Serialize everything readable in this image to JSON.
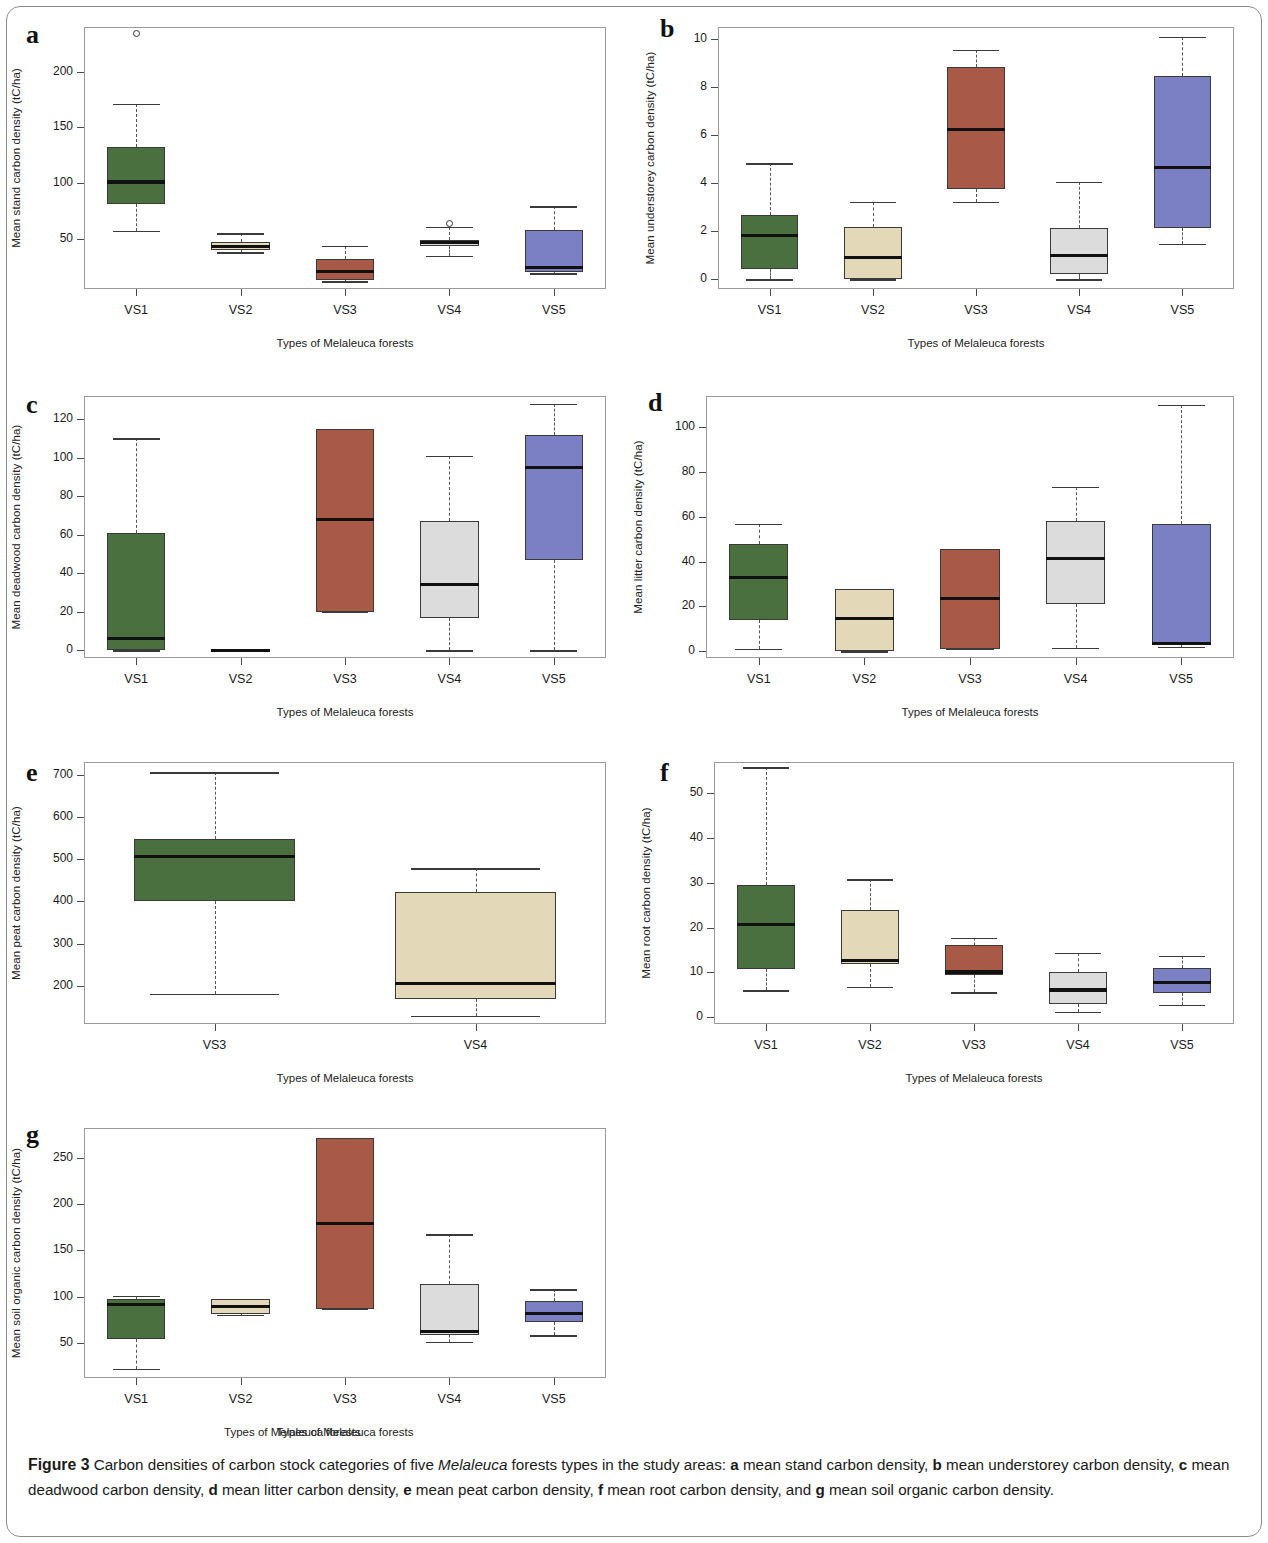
{
  "figure": {
    "number_label": "Figure 3",
    "caption_parts": [
      {
        "t": "  Carbon densities of carbon stock categories of five ",
        "s": "plain"
      },
      {
        "t": "Melaleuca",
        "s": "italic"
      },
      {
        "t": " forests types in the study areas: ",
        "s": "plain"
      },
      {
        "t": "a",
        "s": "bold"
      },
      {
        "t": " mean stand carbon density, ",
        "s": "plain"
      },
      {
        "t": "b",
        "s": "bold"
      },
      {
        "t": " mean understorey carbon density, ",
        "s": "plain"
      },
      {
        "t": "c",
        "s": "bold"
      },
      {
        "t": " mean deadwood carbon density, ",
        "s": "plain"
      },
      {
        "t": "d",
        "s": "bold"
      },
      {
        "t": " mean litter carbon density, ",
        "s": "plain"
      },
      {
        "t": "e",
        "s": "bold"
      },
      {
        "t": " mean peat carbon density, ",
        "s": "plain"
      },
      {
        "t": "f",
        "s": "bold"
      },
      {
        "t": " mean root carbon density, and ",
        "s": "plain"
      },
      {
        "t": "g",
        "s": "bold"
      },
      {
        "t": " mean soil organic carbon density.",
        "s": "plain"
      }
    ],
    "stray_axis_label": "Types of Melaleuca forests"
  },
  "palette": {
    "VS1": "#4a7040",
    "VS2": "#e3d9b8",
    "VS3": "#a85a47",
    "VS4": "#dcdcdc",
    "VS5": "#7b7fc4",
    "box_stroke": "#3a3a3a",
    "median": "#111111",
    "axis": "#9a9a9a"
  },
  "chart_data": [
    {
      "id": "a",
      "type": "box",
      "panel_letter": "a",
      "title": "",
      "xlabel": "Types of Melaleuca forests",
      "ylabel": "Mean stand carbon density (tC/ha)",
      "categories": [
        "VS1",
        "VS2",
        "VS3",
        "VS4",
        "VS5"
      ],
      "ylim": [
        5,
        240
      ],
      "yticks": [
        50,
        100,
        150,
        200
      ],
      "boxes": [
        {
          "cat": "VS1",
          "color": "VS1",
          "whisker_low": 57,
          "q1": 81,
          "median": 101,
          "q3": 132,
          "whisker_high": 171,
          "outliers": [
            234
          ]
        },
        {
          "cat": "VS2",
          "color": "VS2",
          "whisker_low": 38,
          "q1": 40,
          "median": 43,
          "q3": 47,
          "whisker_high": 55,
          "outliers": []
        },
        {
          "cat": "VS3",
          "color": "VS3",
          "whisker_low": 12,
          "q1": 13,
          "median": 21,
          "q3": 32,
          "whisker_high": 44,
          "outliers": []
        },
        {
          "cat": "VS4",
          "color": "VS4",
          "whisker_low": 35,
          "q1": 44,
          "median": 47,
          "q3": 49,
          "whisker_high": 61,
          "outliers": [
            64
          ]
        },
        {
          "cat": "VS5",
          "color": "VS5",
          "whisker_low": 19,
          "q1": 20,
          "median": 24,
          "q3": 58,
          "whisker_high": 79,
          "outliers": []
        }
      ]
    },
    {
      "id": "b",
      "type": "box",
      "panel_letter": "b",
      "title": "",
      "xlabel": "Types of Melaleuca forests",
      "ylabel": "Mean understorey carbon density (tC/ha)",
      "categories": [
        "VS1",
        "VS2",
        "VS3",
        "VS4",
        "VS5"
      ],
      "ylim": [
        -0.4,
        10.5
      ],
      "yticks": [
        0,
        2,
        4,
        6,
        8,
        10
      ],
      "boxes": [
        {
          "cat": "VS1",
          "color": "VS1",
          "whisker_low": 0.0,
          "q1": 0.45,
          "median": 1.83,
          "q3": 2.68,
          "whisker_high": 4.83,
          "outliers": []
        },
        {
          "cat": "VS2",
          "color": "VS2",
          "whisker_low": 0.0,
          "q1": 0.0,
          "median": 0.9,
          "q3": 2.2,
          "whisker_high": 3.22,
          "outliers": []
        },
        {
          "cat": "VS3",
          "color": "VS3",
          "whisker_low": 3.22,
          "q1": 3.75,
          "median": 6.22,
          "q3": 8.85,
          "whisker_high": 9.55,
          "outliers": []
        },
        {
          "cat": "VS4",
          "color": "VS4",
          "whisker_low": 0.0,
          "q1": 0.24,
          "median": 0.98,
          "q3": 2.12,
          "whisker_high": 4.05,
          "outliers": []
        },
        {
          "cat": "VS5",
          "color": "VS5",
          "whisker_low": 1.48,
          "q1": 2.12,
          "median": 4.67,
          "q3": 8.48,
          "whisker_high": 10.08,
          "outliers": []
        }
      ]
    },
    {
      "id": "c",
      "type": "box",
      "panel_letter": "c",
      "title": "",
      "xlabel": "Types of Melaleuca forests",
      "ylabel": "Mean deadwood carbon density (tC/ha)",
      "categories": [
        "VS1",
        "VS2",
        "VS3",
        "VS4",
        "VS5"
      ],
      "ylim": [
        -4,
        132
      ],
      "yticks": [
        0,
        20,
        40,
        60,
        80,
        100,
        120
      ],
      "boxes": [
        {
          "cat": "VS1",
          "color": "VS1",
          "whisker_low": 0,
          "q1": 0,
          "median": 6,
          "q3": 61,
          "whisker_high": 110,
          "outliers": []
        },
        {
          "cat": "VS2",
          "color": "VS2",
          "whisker_low": 0,
          "q1": 0,
          "median": 0,
          "q3": 0,
          "whisker_high": 0,
          "flat": true,
          "outliers": []
        },
        {
          "cat": "VS3",
          "color": "VS3",
          "whisker_low": 20,
          "q1": 20,
          "median": 68,
          "q3": 115,
          "whisker_high": 115,
          "outliers": []
        },
        {
          "cat": "VS4",
          "color": "VS4",
          "whisker_low": 0,
          "q1": 17,
          "median": 34,
          "q3": 67,
          "whisker_high": 101,
          "outliers": []
        },
        {
          "cat": "VS5",
          "color": "VS5",
          "whisker_low": 0,
          "q1": 47,
          "median": 95,
          "q3": 112,
          "whisker_high": 128,
          "outliers": []
        }
      ]
    },
    {
      "id": "d",
      "type": "box",
      "panel_letter": "d",
      "title": "",
      "xlabel": "Types of Melaleuca forests",
      "ylabel": "Mean litter carbon density (tC/ha)",
      "categories": [
        "VS1",
        "VS2",
        "VS3",
        "VS4",
        "VS5"
      ],
      "ylim": [
        -3,
        114
      ],
      "yticks": [
        0,
        20,
        40,
        60,
        80,
        100
      ],
      "boxes": [
        {
          "cat": "VS1",
          "color": "VS1",
          "whisker_low": 1,
          "q1": 14,
          "median": 33,
          "q3": 48,
          "whisker_high": 57,
          "outliers": []
        },
        {
          "cat": "VS2",
          "color": "VS2",
          "whisker_low": 0,
          "q1": 0,
          "median": 14.5,
          "q3": 28,
          "whisker_high": 28,
          "outliers": []
        },
        {
          "cat": "VS3",
          "color": "VS3",
          "whisker_low": 1,
          "q1": 1,
          "median": 23.5,
          "q3": 45.5,
          "whisker_high": 45.5,
          "outliers": []
        },
        {
          "cat": "VS4",
          "color": "VS4",
          "whisker_low": 1.5,
          "q1": 21,
          "median": 41.5,
          "q3": 58,
          "whisker_high": 73.5,
          "outliers": []
        },
        {
          "cat": "VS5",
          "color": "VS5",
          "whisker_low": 2,
          "q1": 3,
          "median": 3.5,
          "q3": 57,
          "whisker_high": 110,
          "outliers": []
        }
      ]
    },
    {
      "id": "e",
      "type": "box",
      "panel_letter": "e",
      "title": "",
      "xlabel": "Types of Melaleuca forests",
      "ylabel": "Mean peat carbon density (tC/ha)",
      "categories": [
        "VS3",
        "VS4"
      ],
      "ylim": [
        110,
        730
      ],
      "yticks": [
        200,
        300,
        400,
        500,
        600,
        700
      ],
      "boxes": [
        {
          "cat": "VS3",
          "color": "VS1",
          "whisker_low": 182,
          "q1": 402,
          "median": 507,
          "q3": 548,
          "whisker_high": 706,
          "outliers": []
        },
        {
          "cat": "VS4",
          "color": "VS2",
          "whisker_low": 130,
          "q1": 170,
          "median": 206,
          "q3": 422,
          "whisker_high": 478,
          "outliers": []
        }
      ]
    },
    {
      "id": "f",
      "type": "box",
      "panel_letter": "f",
      "title": "",
      "xlabel": "Types of Melaleuca forests",
      "ylabel": "Mean root carbon density (tC/ha)",
      "categories": [
        "VS1",
        "VS2",
        "VS3",
        "VS4",
        "VS5"
      ],
      "ylim": [
        -1.5,
        57
      ],
      "yticks": [
        0,
        10,
        20,
        30,
        40,
        50
      ],
      "boxes": [
        {
          "cat": "VS1",
          "color": "VS1",
          "whisker_low": 6.0,
          "q1": 10.8,
          "median": 20.8,
          "q3": 29.5,
          "whisker_high": 55.8,
          "outliers": []
        },
        {
          "cat": "VS2",
          "color": "VS2",
          "whisker_low": 6.8,
          "q1": 11.9,
          "median": 12.7,
          "q3": 24.0,
          "whisker_high": 30.8,
          "outliers": []
        },
        {
          "cat": "VS3",
          "color": "VS3",
          "whisker_low": 5.6,
          "q1": 9.5,
          "median": 10.1,
          "q3": 16.2,
          "whisker_high": 17.7,
          "outliers": []
        },
        {
          "cat": "VS4",
          "color": "VS4",
          "whisker_low": 1.2,
          "q1": 3.0,
          "median": 6.1,
          "q3": 10.0,
          "whisker_high": 14.4,
          "outliers": []
        },
        {
          "cat": "VS5",
          "color": "VS5",
          "whisker_low": 2.8,
          "q1": 5.4,
          "median": 7.7,
          "q3": 11.1,
          "whisker_high": 13.7,
          "outliers": []
        }
      ]
    },
    {
      "id": "g",
      "type": "box",
      "panel_letter": "g",
      "title": "",
      "xlabel": "Types of Melaleuca forests",
      "ylabel": "Mean soil organic carbon density (tC/ha)",
      "categories": [
        "VS1",
        "VS2",
        "VS3",
        "VS4",
        "VS5"
      ],
      "ylim": [
        12,
        282
      ],
      "yticks": [
        50,
        100,
        150,
        200,
        250
      ],
      "boxes": [
        {
          "cat": "VS1",
          "color": "VS1",
          "whisker_low": 22,
          "q1": 54,
          "median": 91,
          "q3": 97,
          "whisker_high": 101,
          "outliers": []
        },
        {
          "cat": "VS2",
          "color": "VS2",
          "whisker_low": 80,
          "q1": 81,
          "median": 89,
          "q3": 97,
          "whisker_high": 97,
          "outliers": []
        },
        {
          "cat": "VS3",
          "color": "VS3",
          "whisker_low": 87,
          "q1": 87,
          "median": 179,
          "q3": 271,
          "whisker_high": 271,
          "outliers": []
        },
        {
          "cat": "VS4",
          "color": "VS4",
          "whisker_low": 51,
          "q1": 58,
          "median": 62,
          "q3": 114,
          "whisker_high": 167,
          "outliers": []
        },
        {
          "cat": "VS5",
          "color": "VS5",
          "whisker_low": 58,
          "q1": 72,
          "median": 82,
          "q3": 95,
          "whisker_high": 108,
          "outliers": []
        }
      ]
    }
  ],
  "panel_geometry": {
    "a": {
      "letter_x": 26,
      "letter_y": 22,
      "plot_x": 84,
      "plot_y": 27,
      "plot_w": 522,
      "plot_h": 262
    },
    "b": {
      "letter_x": 660,
      "letter_y": 16,
      "plot_x": 718,
      "plot_y": 27,
      "plot_w": 516,
      "plot_h": 262
    },
    "c": {
      "letter_x": 26,
      "letter_y": 392,
      "plot_x": 84,
      "plot_y": 396,
      "plot_w": 522,
      "plot_h": 262
    },
    "d": {
      "letter_x": 648,
      "letter_y": 390,
      "plot_x": 706,
      "plot_y": 396,
      "plot_w": 528,
      "plot_h": 262
    },
    "e": {
      "letter_x": 26,
      "letter_y": 760,
      "plot_x": 84,
      "plot_y": 762,
      "plot_w": 522,
      "plot_h": 262
    },
    "f": {
      "letter_x": 660,
      "letter_y": 760,
      "plot_x": 714,
      "plot_y": 762,
      "plot_w": 520,
      "plot_h": 262
    },
    "g": {
      "letter_x": 26,
      "letter_y": 1122,
      "plot_x": 84,
      "plot_y": 1128,
      "plot_w": 522,
      "plot_h": 250
    }
  }
}
